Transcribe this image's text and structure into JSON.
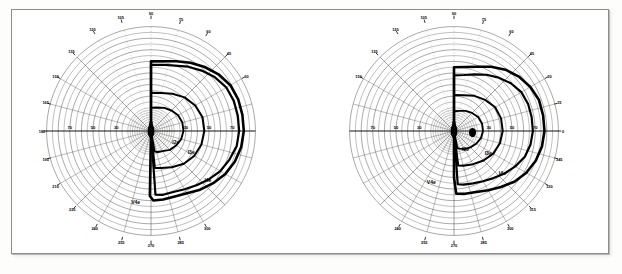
{
  "document": {
    "kind": "goldmann-perimetry-chart-pair",
    "frame_border_color": "#8d8d8d",
    "paper_color": "#ffffff",
    "ink_color": "#000000",
    "grid_color": "#3a3a3a"
  },
  "chart_data": [
    {
      "id": "od",
      "type": "line",
      "title": "",
      "subtitle": "",
      "projection": "polar",
      "coordinate_units": "degrees",
      "orientation": "temporal-right",
      "grid": true,
      "legend_position": "inline-annotations",
      "xlabel": "",
      "ylabel": "",
      "radial_ticks": [
        10,
        20,
        30,
        40,
        50,
        60,
        70,
        80,
        90
      ],
      "radial_tick_labels": [
        "70",
        "50",
        "30",
        "30",
        "50",
        "70"
      ],
      "radial_labelled_values": [
        70,
        50,
        30,
        30,
        50,
        70
      ],
      "angular_ticks_deg": [
        0,
        15,
        30,
        45,
        60,
        75,
        90,
        105,
        120,
        135,
        150,
        165,
        180,
        195,
        210,
        225,
        240,
        255,
        270,
        285,
        300,
        315,
        330,
        345
      ],
      "angular_tick_labels": [
        "180",
        "165",
        "150",
        "135",
        "120",
        "105",
        "90",
        "75",
        "60",
        "45",
        "30",
        "195",
        "210",
        "225",
        "240",
        "255",
        "270",
        "285",
        "300"
      ],
      "angular_labels_drawn": {
        "top": [
          "135",
          "120",
          "105",
          "90",
          "75",
          "60",
          "45"
        ],
        "left": [
          "150",
          "165",
          "180",
          "195",
          "210",
          "225"
        ],
        "right": [
          "30"
        ],
        "bottom": [
          "240",
          "255",
          "270",
          "285",
          "300"
        ]
      },
      "ylim": [
        0,
        90
      ],
      "series": [
        {
          "name": "V4e",
          "label": "V4e",
          "stimulus": "V4e",
          "label_angle_deg": 258,
          "label_radius": 64,
          "linewidth": 2.6,
          "points_deg_r": [
            [
              90,
              60
            ],
            [
              80,
              61
            ],
            [
              70,
              64
            ],
            [
              60,
              68
            ],
            [
              50,
              72
            ],
            [
              40,
              76
            ],
            [
              30,
              79
            ],
            [
              20,
              80
            ],
            [
              10,
              80
            ],
            [
              0,
              80
            ],
            [
              350,
              79
            ],
            [
              340,
              77
            ],
            [
              330,
              74
            ],
            [
              320,
              70
            ],
            [
              310,
              66
            ],
            [
              300,
              62
            ],
            [
              290,
              60
            ],
            [
              280,
              60
            ],
            [
              272,
              60
            ],
            [
              269,
              56
            ],
            [
              269,
              40
            ],
            [
              269,
              20
            ],
            [
              269,
              8
            ],
            [
              269,
              2
            ],
            [
              270,
              1
            ],
            [
              90,
              2
            ],
            [
              90,
              10
            ],
            [
              90,
              25
            ],
            [
              90,
              42
            ],
            [
              90,
              55
            ],
            [
              90,
              60
            ]
          ]
        },
        {
          "name": "I4e",
          "label": "I4e",
          "stimulus": "I4e",
          "label_angle_deg": 318,
          "label_radius": 66,
          "linewidth": 2.2,
          "points_deg_r": [
            [
              90,
              57
            ],
            [
              80,
              58
            ],
            [
              70,
              60
            ],
            [
              60,
              64
            ],
            [
              50,
              68
            ],
            [
              40,
              72
            ],
            [
              30,
              75
            ],
            [
              20,
              76
            ],
            [
              10,
              76
            ],
            [
              0,
              76
            ],
            [
              350,
              75
            ],
            [
              340,
              72
            ],
            [
              330,
              69
            ],
            [
              320,
              65
            ],
            [
              310,
              61
            ],
            [
              300,
              58
            ],
            [
              290,
              56
            ],
            [
              280,
              56
            ],
            [
              274,
              55
            ],
            [
              274,
              38
            ],
            [
              274,
              20
            ],
            [
              274,
              7
            ],
            [
              274,
              2
            ],
            [
              90,
              3
            ],
            [
              90,
              12
            ],
            [
              90,
              28
            ],
            [
              90,
              45
            ],
            [
              90,
              57
            ]
          ]
        },
        {
          "name": "I3e",
          "label": "I3e",
          "stimulus": "I3e",
          "label_angle_deg": 330,
          "label_radius": 40,
          "linewidth": 2.0,
          "points_deg_r": [
            [
              90,
              33
            ],
            [
              75,
              34
            ],
            [
              60,
              37
            ],
            [
              45,
              41
            ],
            [
              30,
              44
            ],
            [
              15,
              46
            ],
            [
              0,
              46
            ],
            [
              345,
              45
            ],
            [
              330,
              43
            ],
            [
              315,
              40
            ],
            [
              300,
              36
            ],
            [
              285,
              33
            ],
            [
              276,
              32
            ],
            [
              276,
              20
            ],
            [
              276,
              10
            ],
            [
              276,
              3
            ],
            [
              90,
              3
            ],
            [
              90,
              12
            ],
            [
              90,
              24
            ],
            [
              90,
              33
            ]
          ]
        },
        {
          "name": "I2e",
          "label": "I2e",
          "stimulus": "I2e",
          "label_angle_deg": 333,
          "label_radius": 24,
          "linewidth": 1.9,
          "points_deg_r": [
            [
              90,
              20
            ],
            [
              75,
              21
            ],
            [
              60,
              23
            ],
            [
              45,
              25
            ],
            [
              30,
              27
            ],
            [
              15,
              28
            ],
            [
              0,
              28
            ],
            [
              345,
              27
            ],
            [
              330,
              25
            ],
            [
              315,
              23
            ],
            [
              300,
              20
            ],
            [
              288,
              19
            ],
            [
              280,
              18
            ],
            [
              280,
              9
            ],
            [
              280,
              3
            ],
            [
              90,
              3
            ],
            [
              90,
              9
            ],
            [
              90,
              15
            ],
            [
              90,
              20
            ]
          ]
        }
      ],
      "annotations": [
        {
          "text": "V4e",
          "angle_deg": 258,
          "radius": 64
        },
        {
          "text": "I4e",
          "angle_deg": 318,
          "radius": 66
        },
        {
          "text": "I3e",
          "angle_deg": 330,
          "radius": 40
        },
        {
          "text": "I2e",
          "angle_deg": 333,
          "radius": 24
        }
      ],
      "blind_spot": {
        "present": false,
        "angle_deg": 0,
        "radius": 0
      },
      "dense_scotoma_bar": {
        "present": true,
        "description": "dense vertical meridian cluster at fixation"
      }
    },
    {
      "id": "os",
      "type": "line",
      "title": "",
      "subtitle": "",
      "projection": "polar",
      "coordinate_units": "degrees",
      "orientation": "temporal-right",
      "grid": true,
      "legend_position": "inline-annotations",
      "xlabel": "",
      "ylabel": "",
      "radial_ticks": [
        10,
        20,
        30,
        40,
        50,
        60,
        70,
        80,
        90
      ],
      "radial_tick_labels": [
        "70",
        "50",
        "30",
        "30",
        "50",
        "70"
      ],
      "radial_labelled_values": [
        70,
        50,
        30,
        30,
        50,
        70
      ],
      "angular_ticks_deg": [
        0,
        15,
        30,
        45,
        60,
        75,
        90,
        105,
        120,
        135,
        150,
        165,
        180,
        195,
        210,
        225,
        240,
        255,
        270,
        285,
        300,
        315,
        330,
        345
      ],
      "angular_labels_drawn": {
        "top": [
          "135",
          "120",
          "105",
          "90",
          "75",
          "60",
          "45"
        ],
        "left": [
          "150"
        ],
        "right": [
          "30",
          "15",
          "0",
          "345",
          "330",
          "315"
        ],
        "bottom": [
          "240",
          "255",
          "270",
          "285",
          "300"
        ]
      },
      "ylim": [
        0,
        90
      ],
      "series": [
        {
          "name": "V4e",
          "label": "V4e",
          "stimulus": "V4e",
          "label_angle_deg": 247,
          "label_radius": 50,
          "linewidth": 2.6,
          "points_deg_r": [
            [
              90,
              55
            ],
            [
              80,
              56
            ],
            [
              70,
              59
            ],
            [
              60,
              64
            ],
            [
              50,
              69
            ],
            [
              40,
              73
            ],
            [
              30,
              76
            ],
            [
              20,
              78
            ],
            [
              10,
              78
            ],
            [
              0,
              78
            ],
            [
              350,
              77
            ],
            [
              340,
              75
            ],
            [
              330,
              72
            ],
            [
              320,
              68
            ],
            [
              310,
              63
            ],
            [
              300,
              59
            ],
            [
              290,
              56
            ],
            [
              280,
              55
            ],
            [
              272,
              54
            ],
            [
              270,
              40
            ],
            [
              270,
              22
            ],
            [
              270,
              8
            ],
            [
              270,
              2
            ],
            [
              90,
              3
            ],
            [
              90,
              14
            ],
            [
              90,
              30
            ],
            [
              90,
              46
            ],
            [
              90,
              55
            ]
          ]
        },
        {
          "name": "I4e",
          "label": "I4e",
          "stimulus": "I4e",
          "label_angle_deg": 318,
          "label_radius": 56,
          "linewidth": 2.2,
          "points_deg_r": [
            [
              90,
              48
            ],
            [
              80,
              49
            ],
            [
              70,
              52
            ],
            [
              60,
              56
            ],
            [
              50,
              60
            ],
            [
              40,
              64
            ],
            [
              30,
              67
            ],
            [
              20,
              68
            ],
            [
              10,
              68
            ],
            [
              0,
              68
            ],
            [
              350,
              67
            ],
            [
              340,
              65
            ],
            [
              330,
              61
            ],
            [
              320,
              57
            ],
            [
              310,
              53
            ],
            [
              300,
              50
            ],
            [
              290,
              48
            ],
            [
              280,
              47
            ],
            [
              274,
              46
            ],
            [
              274,
              30
            ],
            [
              274,
              15
            ],
            [
              274,
              5
            ],
            [
              90,
              4
            ],
            [
              90,
              14
            ],
            [
              90,
              30
            ],
            [
              90,
              42
            ],
            [
              90,
              48
            ]
          ]
        },
        {
          "name": "I3e",
          "label": "I3e",
          "stimulus": "I3e",
          "label_angle_deg": 325,
          "label_radius": 36,
          "linewidth": 2.0,
          "points_deg_r": [
            [
              90,
              31
            ],
            [
              75,
              32
            ],
            [
              60,
              35
            ],
            [
              45,
              38
            ],
            [
              30,
              41
            ],
            [
              15,
              42
            ],
            [
              0,
              42
            ],
            [
              345,
              41
            ],
            [
              330,
              39
            ],
            [
              315,
              36
            ],
            [
              300,
              33
            ],
            [
              285,
              31
            ],
            [
              277,
              30
            ],
            [
              277,
              18
            ],
            [
              277,
              8
            ],
            [
              277,
              3
            ],
            [
              90,
              3
            ],
            [
              90,
              12
            ],
            [
              90,
              22
            ],
            [
              90,
              31
            ]
          ]
        },
        {
          "name": "I2e",
          "label": "I2e",
          "stimulus": "I2e",
          "label_angle_deg": 300,
          "label_radius": 20,
          "linewidth": 1.9,
          "points_deg_r": [
            [
              90,
              17
            ],
            [
              75,
              18
            ],
            [
              60,
              20
            ],
            [
              45,
              22
            ],
            [
              30,
              24
            ],
            [
              15,
              25
            ],
            [
              0,
              25
            ],
            [
              345,
              24
            ],
            [
              330,
              22
            ],
            [
              315,
              20
            ],
            [
              300,
              18
            ],
            [
              288,
              16
            ],
            [
              281,
              15
            ],
            [
              281,
              8
            ],
            [
              281,
              3
            ],
            [
              90,
              3
            ],
            [
              90,
              8
            ],
            [
              90,
              13
            ],
            [
              90,
              17
            ]
          ]
        }
      ],
      "annotations": [
        {
          "text": "V4e",
          "angle_deg": 247,
          "radius": 50
        },
        {
          "text": "I4e",
          "angle_deg": 318,
          "radius": 56
        },
        {
          "text": "I3e",
          "angle_deg": 325,
          "radius": 36
        },
        {
          "text": "I2e",
          "angle_deg": 300,
          "radius": 20
        }
      ],
      "blind_spot": {
        "present": true,
        "angle_deg": 355,
        "radius": 16,
        "label": ""
      },
      "dense_scotoma_bar": {
        "present": true,
        "description": "dense vertical meridian cluster at fixation"
      }
    }
  ]
}
